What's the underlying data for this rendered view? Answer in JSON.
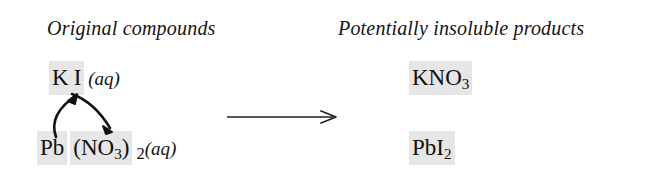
{
  "diagram": {
    "type": "double-replacement-reaction",
    "background_color": "#ffffff",
    "text_color": "#111111",
    "highlight_color": "#e6e6e6"
  },
  "headings": {
    "reactants": "Original compounds",
    "products": "Potentially insoluble products"
  },
  "reactants": [
    {
      "id": "potassium-iodide",
      "cation": "K",
      "anion": "I",
      "anion_subscript": "",
      "state": "(aq)",
      "highlighted": true
    },
    {
      "id": "lead-nitrate",
      "cation": "Pb",
      "anion": "(NO",
      "anion_subscript": "3",
      "anion_close": ")",
      "stoichiometry": "2",
      "state": "(aq)",
      "highlighted": true
    }
  ],
  "products": [
    {
      "id": "potassium-nitrate",
      "formula_main": "KNO",
      "subscript": "3",
      "highlighted": true
    },
    {
      "id": "lead-iodide",
      "formula_main": "PbI",
      "subscript": "2",
      "highlighted": true
    }
  ],
  "arrows": {
    "reaction_arrow": "yields-right-arrow",
    "swap_arrow_up": "cation-anion-swap-up-arrow",
    "swap_arrow_down": "cation-anion-swap-down-arrow"
  }
}
